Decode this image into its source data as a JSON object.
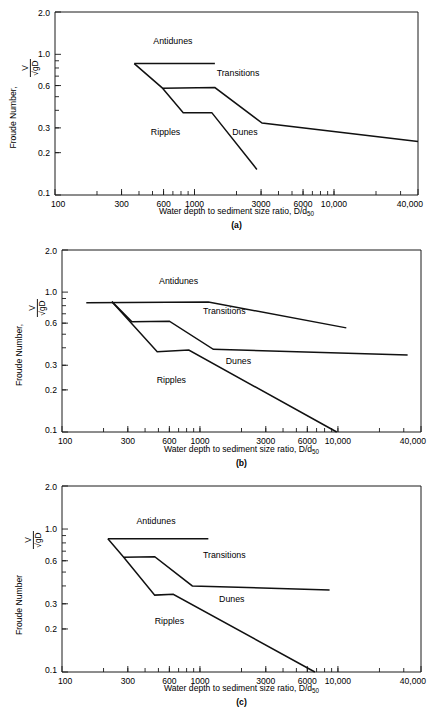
{
  "figure": {
    "axis_x_title_prefix": "Water depth to sediment size ratio, D/d",
    "axis_x_title_subscript": "50",
    "y_axis_label_with_comma": "Froude Number,",
    "y_axis_label_plain": "Froude Number",
    "y_axis_fraction_numerator": "V",
    "y_axis_fraction_denominator": "√gD",
    "line_color": "#111111",
    "axis_color": "#1a1a1a",
    "background_color": "#ffffff"
  },
  "chart_data": [
    {
      "type": "line",
      "panel": "(a)",
      "title": "",
      "xlabel": "Water depth to sediment size ratio, D/d50",
      "ylabel": "Froude Number, V/√gD",
      "xscale": "log",
      "yscale": "log",
      "xlim": [
        100,
        40000
      ],
      "ylim": [
        0.1,
        2.0
      ],
      "grid": false,
      "legend": "none",
      "xticks": [
        100,
        300,
        600,
        1000,
        3000,
        6000,
        10000,
        40000
      ],
      "xtick_labels": [
        "100",
        "300",
        "600",
        "1000",
        "3000",
        "6000",
        "10,000",
        "40,000"
      ],
      "yticks": [
        0.1,
        0.2,
        0.3,
        0.6,
        1.0,
        2.0
      ],
      "ytick_labels": [
        "0.1",
        "0.2",
        "0.3",
        "0.6",
        "1.0",
        "2.0"
      ],
      "annotations": [
        {
          "text": "Antidunes",
          "x": 700,
          "y": 1.18
        },
        {
          "text": "Transitions",
          "x": 2050,
          "y": 0.7
        },
        {
          "text": "Ripples",
          "x": 620,
          "y": 0.265
        },
        {
          "text": "Dunes",
          "x": 2300,
          "y": 0.265
        }
      ],
      "series": [
        {
          "name": "antidunes-transitions-boundary",
          "points": [
            [
              370,
              0.86
            ],
            [
              1400,
              0.86
            ]
          ]
        },
        {
          "name": "transitions-dunes-boundary",
          "points": [
            [
              370,
              0.86
            ],
            [
              590,
              0.575
            ],
            [
              1400,
              0.58
            ],
            [
              3050,
              0.325
            ],
            [
              40000,
              0.24
            ]
          ]
        },
        {
          "name": "ripples-dunes-boundary",
          "points": [
            [
              590,
              0.575
            ],
            [
              830,
              0.385
            ],
            [
              1330,
              0.385
            ],
            [
              2800,
              0.152
            ]
          ]
        }
      ]
    },
    {
      "type": "line",
      "panel": "(b)",
      "title": "",
      "xlabel": "Water depth to sediment size ratio, D/d50",
      "ylabel": "Froude Number, V/√gD",
      "xscale": "log",
      "yscale": "log",
      "xlim": [
        100,
        40000
      ],
      "ylim": [
        0.1,
        2.0
      ],
      "grid": false,
      "legend": "none",
      "xticks": [
        100,
        300,
        600,
        1000,
        3000,
        6000,
        10000,
        40000
      ],
      "xtick_labels": [
        "100",
        "300",
        "600",
        "1000",
        "3000",
        "6000",
        "10,000",
        "40,000"
      ],
      "yticks": [
        0.1,
        0.2,
        0.3,
        0.6,
        1.0,
        2.0
      ],
      "ytick_labels": [
        "0.1",
        "0.2",
        "0.3",
        "0.6",
        "1.0",
        "2.0"
      ],
      "annotations": [
        {
          "text": "Antidunes",
          "x": 700,
          "y": 1.14
        },
        {
          "text": "Transitions",
          "x": 1500,
          "y": 0.7
        },
        {
          "text": "Ripples",
          "x": 620,
          "y": 0.225
        },
        {
          "text": "Dunes",
          "x": 1900,
          "y": 0.305
        }
      ],
      "series": [
        {
          "name": "antidunes-transitions-boundary",
          "points": [
            [
              150,
              0.84
            ],
            [
              1150,
              0.85
            ],
            [
              11500,
              0.555
            ]
          ]
        },
        {
          "name": "transitions-dunes-boundary",
          "points": [
            [
              230,
              0.855
            ],
            [
              320,
              0.615
            ],
            [
              600,
              0.62
            ],
            [
              1250,
              0.39
            ],
            [
              32000,
              0.355
            ]
          ]
        },
        {
          "name": "ripples-dunes-boundary",
          "points": [
            [
              230,
              0.855
            ],
            [
              490,
              0.375
            ],
            [
              830,
              0.385
            ],
            [
              9800,
              0.1
            ]
          ]
        }
      ]
    },
    {
      "type": "line",
      "panel": "(c)",
      "title": "",
      "xlabel": "Water depth to sediment size ratio, D/d50",
      "ylabel": "Froude Number V/√gD",
      "xscale": "log",
      "yscale": "log",
      "xlim": [
        100,
        40000
      ],
      "ylim": [
        0.1,
        2.0
      ],
      "grid": false,
      "legend": "none",
      "xticks": [
        100,
        300,
        600,
        1000,
        3000,
        6000,
        10000,
        40000
      ],
      "xtick_labels": [
        "100",
        "300",
        "600",
        "1000",
        "3000",
        "6000",
        "10,000",
        "40,000"
      ],
      "yticks": [
        0.1,
        0.2,
        0.3,
        0.6,
        1.0,
        2.0
      ],
      "ytick_labels": [
        "0.1",
        "0.2",
        "0.3",
        "0.6",
        "1.0",
        "2.0"
      ],
      "annotations": [
        {
          "text": "Antidunes",
          "x": 480,
          "y": 1.08
        },
        {
          "text": "Transitions",
          "x": 1500,
          "y": 0.63
        },
        {
          "text": "Ripples",
          "x": 600,
          "y": 0.215
        },
        {
          "text": "Dunes",
          "x": 1700,
          "y": 0.31
        }
      ],
      "series": [
        {
          "name": "antidunes-transitions-boundary",
          "points": [
            [
              215,
              0.855
            ],
            [
              1150,
              0.855
            ]
          ]
        },
        {
          "name": "transitions-dunes-boundary",
          "points": [
            [
              215,
              0.855
            ],
            [
              280,
              0.635
            ],
            [
              470,
              0.64
            ],
            [
              880,
              0.4
            ],
            [
              8700,
              0.375
            ]
          ]
        },
        {
          "name": "ripples-dunes-boundary",
          "points": [
            [
              280,
              0.635
            ],
            [
              470,
              0.345
            ],
            [
              640,
              0.35
            ],
            [
              6800,
              0.1
            ]
          ]
        }
      ]
    }
  ]
}
